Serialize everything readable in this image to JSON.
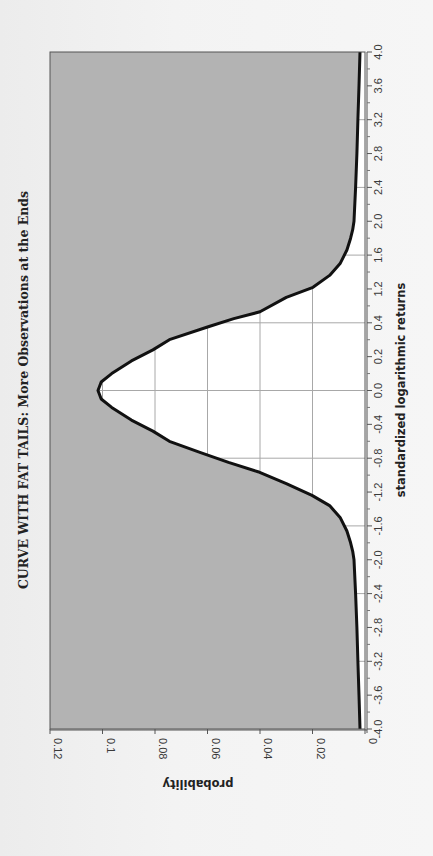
{
  "chart_data": {
    "type": "area",
    "orientation": "rotated-90-ccw",
    "title": "CURVE WITH FAT TAILS: More Observations at the Ends",
    "xlabel": "standardized logarithmic returns",
    "ylabel": "probability",
    "x_tick_labels": [
      "-4.0",
      "-3.6",
      "-3.2",
      "-2.8",
      "-2.4",
      "-2.0",
      "-1.6",
      "-1.2",
      "-0.8",
      "-0.4",
      "0.0",
      "0.2",
      "0.4",
      "1.2",
      "1.6",
      "2.0",
      "2.4",
      "2.8",
      "3.2",
      "3.6",
      "4.0"
    ],
    "y_tick_labels": [
      "0",
      "0.02",
      "0.04",
      "0.06",
      "0.08",
      "0.1",
      "0.12"
    ],
    "ylim": [
      0,
      0.12
    ],
    "grid": true,
    "legend": null,
    "fill_color": "#b3b3b3",
    "line_color": "#111111",
    "x": [
      -4.0,
      -3.6,
      -3.2,
      -2.8,
      -2.4,
      -2.0,
      -1.9,
      -1.8,
      -1.66,
      -1.5,
      -1.36,
      -1.24,
      -1.1,
      -0.96,
      -0.85,
      -0.73,
      -0.6,
      -0.48,
      -0.35,
      -0.2,
      -0.1,
      0.0,
      0.1,
      0.2,
      0.35,
      0.48,
      0.6,
      0.75,
      0.85,
      0.93,
      1.1,
      1.22,
      1.36,
      1.5,
      1.66,
      1.8,
      1.9,
      2.0,
      2.4,
      2.8,
      3.2,
      3.6,
      4.0
    ],
    "values": [
      0.0019,
      0.0023,
      0.0027,
      0.0031,
      0.0036,
      0.0042,
      0.0047,
      0.0055,
      0.0069,
      0.0095,
      0.0135,
      0.0202,
      0.03,
      0.0408,
      0.052,
      0.0629,
      0.0745,
      0.0808,
      0.089,
      0.0965,
      0.1005,
      0.1017,
      0.1005,
      0.0965,
      0.089,
      0.0808,
      0.0745,
      0.06,
      0.05,
      0.04,
      0.03,
      0.0198,
      0.0135,
      0.0095,
      0.0069,
      0.0055,
      0.0047,
      0.0042,
      0.0036,
      0.0031,
      0.0027,
      0.0023,
      0.0019
    ]
  }
}
